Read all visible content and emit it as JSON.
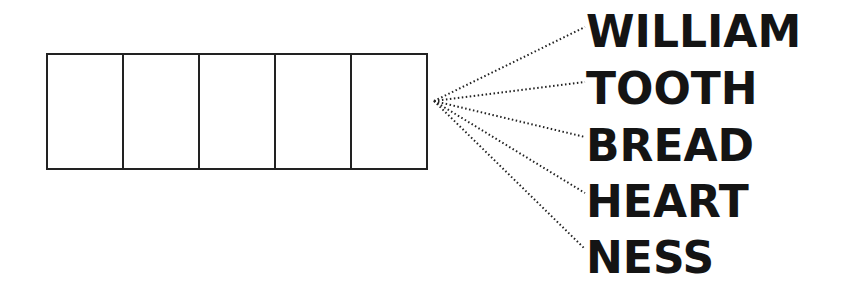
{
  "diagram": {
    "cells": [
      {
        "label": ""
      },
      {
        "label": ""
      },
      {
        "label": ""
      },
      {
        "label": ""
      },
      {
        "label": ""
      }
    ],
    "fan_origin": [
      434,
      101
    ],
    "words": [
      {
        "text": "WILLIAM",
        "top": 10,
        "anchor": [
          585,
          27
        ]
      },
      {
        "text": "TOOTH",
        "top": 67,
        "anchor": [
          585,
          82
        ]
      },
      {
        "text": "BREAD",
        "top": 124,
        "anchor": [
          585,
          137
        ]
      },
      {
        "text": "HEART",
        "top": 180,
        "anchor": [
          585,
          193
        ]
      },
      {
        "text": "NESS",
        "top": 236,
        "anchor": [
          585,
          249
        ]
      }
    ],
    "line_color": "#222222"
  }
}
